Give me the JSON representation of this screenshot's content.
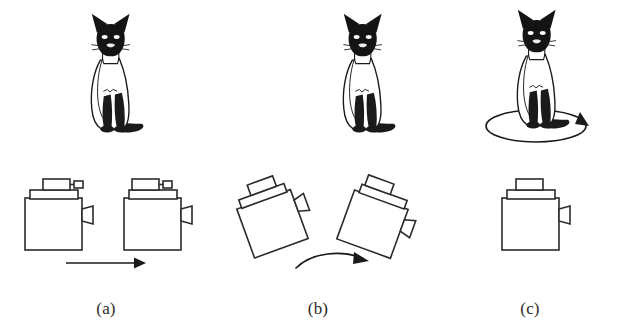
{
  "figure": {
    "background_color": "#ffffff",
    "ink_color": "#231f20",
    "width": 636,
    "height": 327,
    "caption_font_style": "serif",
    "panels": [
      {
        "id": "a",
        "label": "(a)",
        "subject": {
          "name": "siamese-cat",
          "state": "sitting-upright-facing-viewer",
          "motion_indicator": "none"
        },
        "devices": [
          {
            "name": "camera-left",
            "rotation_deg": 0,
            "has_top_viewfinder_nub": true,
            "has_side_lens_flap": true
          },
          {
            "name": "camera-right",
            "rotation_deg": 0,
            "has_top_viewfinder_nub": true,
            "has_side_lens_flap": true
          }
        ],
        "arrow": {
          "name": "translation-arrow",
          "type": "straight",
          "direction": "left-to-right",
          "meaning": "translation"
        }
      },
      {
        "id": "b",
        "label": "(b)",
        "subject": {
          "name": "siamese-cat",
          "state": "sitting-upright-facing-viewer",
          "motion_indicator": "none"
        },
        "devices": [
          {
            "name": "camera-left-tilted",
            "rotation_deg": -20,
            "has_top_viewfinder_nub": false,
            "has_side_lens_flap": true
          },
          {
            "name": "camera-right-tilted",
            "rotation_deg": 20,
            "has_top_viewfinder_nub": false,
            "has_side_lens_flap": true
          }
        ],
        "arrow": {
          "name": "rotation-arc-arrow",
          "type": "curved",
          "direction": "left-to-right",
          "meaning": "camera-rotation"
        }
      },
      {
        "id": "c",
        "label": "(c)",
        "subject": {
          "name": "siamese-cat",
          "state": "sitting-upright-facing-viewer",
          "motion_indicator": "rotating-ellipse-with-arrowhead"
        },
        "devices": [
          {
            "name": "camera-center",
            "rotation_deg": 0,
            "has_top_viewfinder_nub": false,
            "has_side_lens_flap": true
          }
        ],
        "arrow": {
          "name": "object-rotation-ellipse",
          "type": "ellipse",
          "direction": "clockwise",
          "meaning": "object-rotation"
        }
      }
    ]
  }
}
